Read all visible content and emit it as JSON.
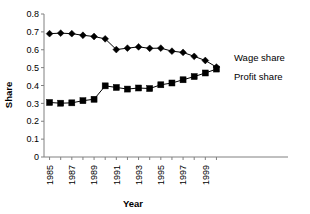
{
  "chart_data": {
    "type": "line",
    "title": "",
    "xlabel": "Year",
    "ylabel": "Share",
    "x": [
      1985,
      1986,
      1987,
      1988,
      1989,
      1990,
      1991,
      1992,
      1993,
      1994,
      1995,
      1996,
      1997,
      1998,
      1999,
      2000
    ],
    "xlim": [
      1984.5,
      2000.5
    ],
    "ylim": [
      0,
      0.8
    ],
    "ytick_labels": [
      "0",
      "0.1",
      "0.2",
      "0.3",
      "0.4",
      "0.5",
      "0.6",
      "0.7",
      "0.8"
    ],
    "ytick_values": [
      0,
      0.1,
      0.2,
      0.3,
      0.4,
      0.5,
      0.6,
      0.7,
      0.8
    ],
    "xtick_labels": [
      "1985",
      "1987",
      "1989",
      "1991",
      "1993",
      "1995",
      "1997",
      "1999"
    ],
    "xtick_values": [
      1985,
      1987,
      1989,
      1991,
      1993,
      1995,
      1997,
      1999
    ],
    "grid": false,
    "legend_position": "inline-right",
    "series": [
      {
        "name": "Wage share",
        "marker": "diamond",
        "color": "#000000",
        "values": [
          0.69,
          0.693,
          0.69,
          0.681,
          0.674,
          0.661,
          0.601,
          0.609,
          0.616,
          0.608,
          0.609,
          0.592,
          0.585,
          0.563,
          0.54,
          0.503
        ]
      },
      {
        "name": "Profit share",
        "marker": "square",
        "color": "#000000",
        "values": [
          0.305,
          0.301,
          0.303,
          0.315,
          0.323,
          0.398,
          0.389,
          0.38,
          0.386,
          0.383,
          0.404,
          0.414,
          0.432,
          0.45,
          0.47,
          0.492
        ]
      }
    ],
    "annotations": [
      {
        "text": "Wage share",
        "series": "Wage share"
      },
      {
        "text": "Profit share",
        "series": "Profit share"
      }
    ]
  }
}
